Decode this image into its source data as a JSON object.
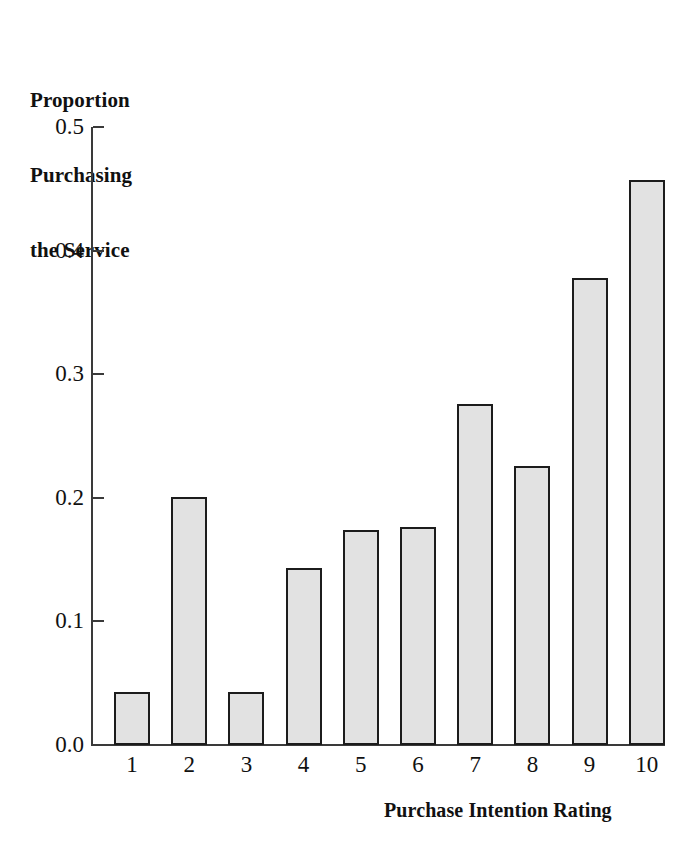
{
  "chart_data": {
    "type": "bar",
    "title": "",
    "ylabel": "Proportion Purchasing the Service",
    "ylabel_lines": [
      "Proportion",
      "Purchasing",
      "the Service"
    ],
    "xlabel": "Purchase Intention Rating",
    "categories": [
      "1",
      "2",
      "3",
      "4",
      "5",
      "6",
      "7",
      "8",
      "9",
      "10"
    ],
    "values": [
      0.043,
      0.201,
      0.043,
      0.143,
      0.174,
      0.176,
      0.276,
      0.226,
      0.378,
      0.457
    ],
    "ylim": [
      0.0,
      0.5
    ],
    "ytick_labels": [
      "0.5",
      "0.4",
      "0.3",
      "0.2",
      "0.1",
      "0.0"
    ],
    "ytick_values": [
      0.5,
      0.4,
      0.3,
      0.2,
      0.1,
      0.0
    ],
    "grid": false,
    "legend": false,
    "legend_position": "none",
    "bar_fill_color": "#e2e2e2",
    "bar_edge_color": "#1c1c1c",
    "axis_color": "#3a3a3a",
    "background_color": "#ffffff"
  }
}
